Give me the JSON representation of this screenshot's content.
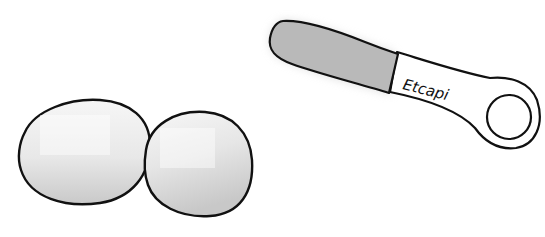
{
  "illustration": {
    "subject": "Two eggs and a spatula with hanging loop",
    "objects": [
      {
        "name": "egg",
        "count": 2,
        "fill": "#f0f0f0",
        "shade": "#cfcfcf",
        "outline": "#111111"
      },
      {
        "name": "spatula",
        "blade_fill": "#b8b8b8",
        "handle_fill": "#ffffff",
        "outline": "#111111"
      }
    ],
    "spatula": {
      "handle_label": "Etcapi"
    },
    "colors": {
      "background": "#ffffff",
      "outline": "#111111",
      "blade": "#b9b9b9",
      "egg_light": "#f2f2f2",
      "egg_shadow": "#cdcdcd"
    }
  }
}
